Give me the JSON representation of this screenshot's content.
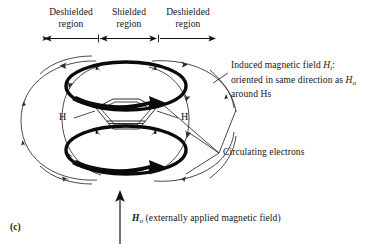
{
  "figure": {
    "panel_letter": "(c)",
    "region_labels": [
      {
        "name": "deshielded-left",
        "line1": "Deshielded",
        "line2": "region"
      },
      {
        "name": "shielded-center",
        "line1": "Shielded",
        "line2": "region"
      },
      {
        "name": "deshielded-right",
        "line1": "Deshielded",
        "line2": "region"
      }
    ],
    "annotations": {
      "induced_field": {
        "line1_prefix": "Induced magnetic field ",
        "line1_symbol": "H",
        "line1_symbol_sub": "i",
        "line1_suffix": ":",
        "line2_prefix": "oriented in same direction as ",
        "line2_symbol": "H",
        "line2_symbol_sub": "o",
        "line3": "around Hs"
      },
      "circulating_electrons": "Circulating electrons",
      "applied_field": {
        "symbol": "H",
        "symbol_sub": "o",
        "text": " (externally applied magnetic field)"
      }
    },
    "hydrogen_labels": [
      {
        "name": "hydrogen-left",
        "text": "H"
      },
      {
        "name": "hydrogen-right",
        "text": "H"
      }
    ],
    "colors": {
      "ink": "#141414",
      "background": "#ffffff",
      "ring_current": "#0a0a0a",
      "field_line": "#2b2b2b"
    }
  }
}
